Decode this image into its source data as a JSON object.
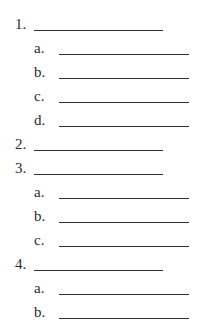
{
  "outline": {
    "items": [
      {
        "label": "1.",
        "level": "main"
      },
      {
        "label": "a.",
        "level": "sub"
      },
      {
        "label": "b.",
        "level": "sub"
      },
      {
        "label": "c.",
        "level": "sub"
      },
      {
        "label": "d.",
        "level": "sub"
      },
      {
        "label": "2.",
        "level": "main"
      },
      {
        "label": "3.",
        "level": "main"
      },
      {
        "label": "a.",
        "level": "sub"
      },
      {
        "label": "b.",
        "level": "sub"
      },
      {
        "label": "c.",
        "level": "sub"
      },
      {
        "label": "4.",
        "level": "main"
      },
      {
        "label": "a.",
        "level": "sub"
      },
      {
        "label": "b.",
        "level": "sub"
      }
    ]
  }
}
